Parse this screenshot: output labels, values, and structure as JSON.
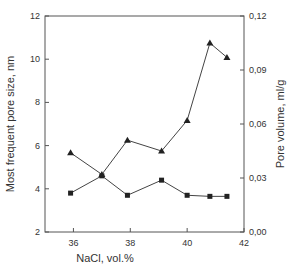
{
  "chart_data": {
    "type": "line",
    "title": "",
    "xlabel": "NaCl, vol.%",
    "ylabel": "Most frequent pore size, nm",
    "y2label": "Pore volume, ml/g",
    "xlim": [
      35,
      42
    ],
    "ylim": [
      2,
      12
    ],
    "y2lim": [
      0.0,
      0.12
    ],
    "xticks": [
      36,
      38,
      40,
      42
    ],
    "xtick_labels": [
      "36",
      "38",
      "40",
      "42"
    ],
    "yticks": [
      2,
      4,
      6,
      8,
      10,
      12
    ],
    "ytick_labels": [
      "2",
      "4",
      "6",
      "8",
      "10",
      "12"
    ],
    "y2ticks": [
      0.0,
      0.03,
      0.06,
      0.09,
      0.12
    ],
    "y2tick_labels": [
      "0,00",
      "0,03",
      "0,06",
      "0,09",
      "0,12"
    ],
    "grid": false,
    "legend": null,
    "series": [
      {
        "name": "Most frequent pore size",
        "axis": "left",
        "marker": "square",
        "color": "#222222",
        "x": [
          35.9,
          37.0,
          37.9,
          39.1,
          40.0,
          40.8,
          41.4
        ],
        "values": [
          3.8,
          4.6,
          3.7,
          4.4,
          3.7,
          3.65,
          3.65
        ]
      },
      {
        "name": "Pore volume",
        "axis": "right",
        "marker": "triangle",
        "color": "#222222",
        "x": [
          35.9,
          37.0,
          37.9,
          39.1,
          40.0,
          40.8,
          41.4
        ],
        "values": [
          0.044,
          0.032,
          0.051,
          0.045,
          0.062,
          0.105,
          0.097
        ]
      }
    ]
  }
}
